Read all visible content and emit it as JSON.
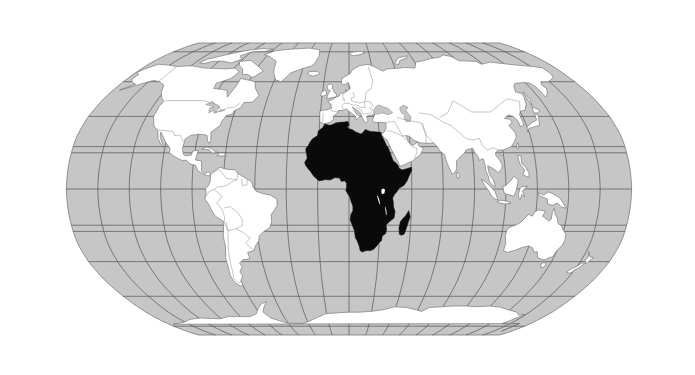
{
  "map": {
    "title": "World map highlighting Africa",
    "projection": "Robinson",
    "highlighted_region": "Africa",
    "colors": {
      "ocean": "#c6c6c6",
      "land": "#ffffff",
      "highlight": "#0a0a0a",
      "graticule": "#555555",
      "coastline": "#6a6a6a"
    },
    "graticule": {
      "meridian_step_deg": 20,
      "parallels_deg": [
        -80,
        -60,
        -40,
        -23.44,
        -20,
        0,
        20,
        23.44,
        40,
        60,
        80
      ]
    },
    "regions": [
      {
        "name": "North America",
        "highlighted": false
      },
      {
        "name": "Greenland",
        "highlighted": false
      },
      {
        "name": "South America",
        "highlighted": false
      },
      {
        "name": "Europe",
        "highlighted": false
      },
      {
        "name": "Asia",
        "highlighted": false
      },
      {
        "name": "Africa",
        "highlighted": true
      },
      {
        "name": "Madagascar",
        "highlighted": true
      },
      {
        "name": "Australia",
        "highlighted": false
      },
      {
        "name": "New Zealand",
        "highlighted": false
      },
      {
        "name": "Antarctica",
        "highlighted": false
      }
    ]
  }
}
